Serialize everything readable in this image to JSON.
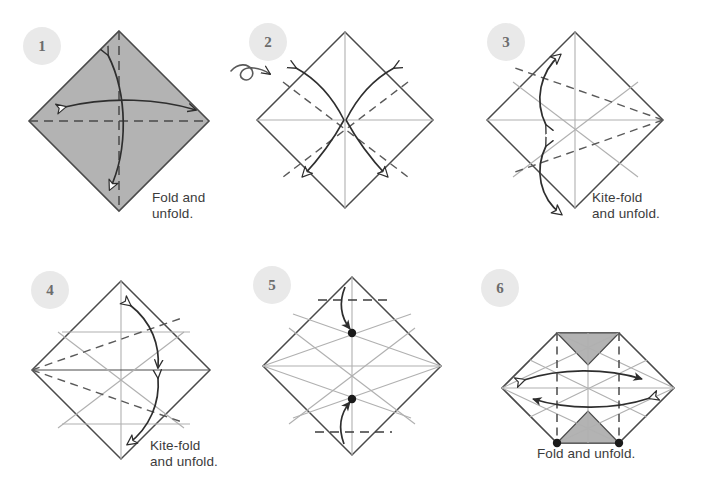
{
  "page": {
    "background_color": "#ffffff",
    "width": 702,
    "height": 487
  },
  "style": {
    "paper_fill_shaded": "#b3b3b3",
    "paper_fill_white": "#ffffff",
    "edge_color": "#4a4a4a",
    "crease_color": "#9a9a9a",
    "dashed_color": "#5a5a5a",
    "arrow_color": "#2e2e2e",
    "badge_fill": "#e9e9e9",
    "badge_text": "#6c6c6c",
    "caption_color": "#3b3b3b",
    "dot_color": "#1a1a1a"
  },
  "steps": [
    {
      "number": "1",
      "badge": {
        "cx": 42,
        "cy": 46
      },
      "caption": "Fold and\nunfold.",
      "shading": "shaded",
      "center": {
        "x": 119,
        "y": 121
      },
      "radius": 90
    },
    {
      "number": "2",
      "badge": {
        "cx": 268,
        "cy": 42
      },
      "caption": "",
      "shading": "white",
      "center": {
        "x": 345,
        "y": 120
      },
      "radius": 88
    },
    {
      "number": "3",
      "badge": {
        "cx": 506,
        "cy": 42
      },
      "caption": "Kite-fold\nand unfold.",
      "shading": "white",
      "center": {
        "x": 575,
        "y": 120
      },
      "radius": 88
    },
    {
      "number": "4",
      "badge": {
        "cx": 50,
        "cy": 290
      },
      "caption": "Kite-fold\nand unfold.",
      "shading": "white",
      "center": {
        "x": 121,
        "y": 370
      },
      "radius": 89
    },
    {
      "number": "5",
      "badge": {
        "cx": 272,
        "cy": 285
      },
      "caption": "",
      "shading": "white",
      "center": {
        "x": 352,
        "y": 366
      },
      "radius": 89
    },
    {
      "number": "6",
      "badge": {
        "cx": 500,
        "cy": 288
      },
      "caption": "Fold and unfold.",
      "shading": "white",
      "center": {
        "x": 588,
        "y": 363
      },
      "radius": 86
    }
  ],
  "symbols": {
    "flip_over_arrow": "turn-over-arrow",
    "valley_fold_line": "dashed",
    "existing_crease_line": "thin-solid-gray",
    "fold_arrow": "curved-hollow-arrowhead",
    "reference_point": "filled-dot"
  }
}
